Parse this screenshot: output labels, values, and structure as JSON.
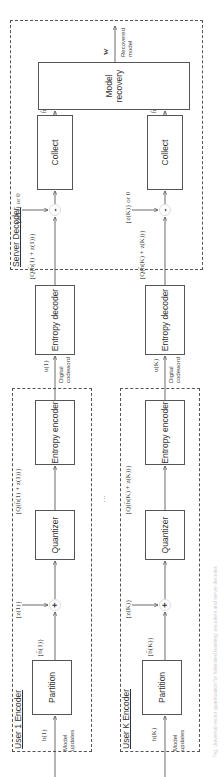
{
  "server": {
    "title": "Server Decoder",
    "entropy_decoder": "Entropy decoder",
    "collect": "Collect",
    "model_recovery": "Model recovery",
    "output_symbol": "w",
    "output_label": "Recovered model",
    "row1": {
      "input_symbol": "u(1)",
      "quant_set": "{Q(h̃(1) + z(1))}",
      "dither": "{z(1)} or 0",
      "collect_out": "ĥ(1)"
    },
    "rowK": {
      "input_symbol": "u(K)",
      "quant_set": "{Q(h̃(K) + z(K))}",
      "dither": "{z(K)} or 0",
      "collect_out": "ĥ(K)"
    },
    "channel_label": "Digital codeword"
  },
  "encoders": [
    {
      "title": "User 1 Encoder",
      "input_label": "Model updates",
      "input_symbol": "h(1)",
      "partition": "Partition",
      "partition_out": "{h̃(1)}",
      "dither": "{z(1)}",
      "plus": "+",
      "quantizer": "Quantizer",
      "quant_out": "{Q(h̃(1) + z(1))}",
      "entropy_encoder": "Entropy encoder"
    },
    {
      "title": "User K Encoder",
      "input_label": "Model updates",
      "input_symbol": "h(K)",
      "partition": "Partition",
      "partition_out": "{h̃(K)}",
      "dither": "{z(K)}",
      "plus": "+",
      "quantizer": "Quantizer",
      "quant_out": "{Q(h̃(K) + z(K))}",
      "entropy_encoder": "Entropy encoder"
    }
  ],
  "ellipsis": "⋮",
  "minus": "-",
  "caption": "Fig. Universal vector quantization for federated learning: encoders and server decoder."
}
